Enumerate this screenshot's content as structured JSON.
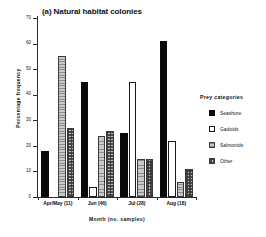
{
  "chart_data": {
    "type": "bar",
    "title": "(a) Natural habitat colonies",
    "xlabel": "Month (no. samples)",
    "ylabel": "Percentage  frequency",
    "ylim": [
      0,
      70
    ],
    "yticks": [
      0,
      10,
      20,
      30,
      40,
      50,
      60,
      70
    ],
    "ytick_labels": [
      "0",
      "10",
      "20",
      "30",
      "40",
      "50",
      "60",
      "70"
    ],
    "grid": false,
    "legend_position": "right",
    "legend_title": "Prey  categories",
    "categories": [
      "Apr/May  (11)",
      "Jun  (46)",
      "Jul  (28)",
      "Aug  (18)"
    ],
    "category_months": [
      "Apr/May",
      "Jun",
      "Jul",
      "Aug"
    ],
    "category_samples": [
      "(11)",
      "(46)",
      "(28)",
      "(18)"
    ],
    "series": [
      {
        "name": "Seashore",
        "fill": "solid-black",
        "values": [
          18,
          45,
          25,
          61
        ]
      },
      {
        "name": "Gadoids",
        "fill": "open-white",
        "values": [
          0,
          4,
          45,
          22
        ]
      },
      {
        "name": "Salmonids",
        "fill": "light-gray",
        "values": [
          55,
          24,
          15,
          6
        ]
      },
      {
        "name": "Other",
        "fill": "checkered",
        "values": [
          27,
          26,
          15,
          11
        ]
      }
    ]
  },
  "colors": {
    "seashore": "#0a0a0a",
    "gadoids": "#ffffff",
    "salmonids": "#c9c9c9",
    "other": "#bdbdbd",
    "axis": "#2b2b2b",
    "background": "#ffffff"
  }
}
